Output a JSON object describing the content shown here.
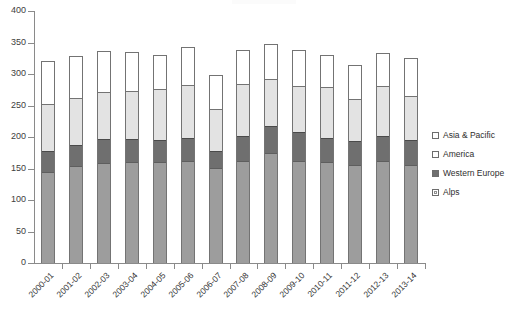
{
  "chart_data": {
    "type": "bar",
    "subtype": "stacked-vertical",
    "title": "",
    "subtitle": "",
    "xlabel": "",
    "ylabel": "",
    "ylim": [
      0,
      400
    ],
    "yticks": [
      0,
      50,
      100,
      150,
      200,
      250,
      300,
      350,
      400
    ],
    "ytick_labels": [
      "0",
      "50",
      "100",
      "150",
      "200",
      "250",
      "300",
      "350",
      "400"
    ],
    "grid": false,
    "legend_position": "right",
    "categories": [
      "2000-01",
      "2001-02",
      "2002-03",
      "2003-04",
      "2004-05",
      "2005-06",
      "2006-07",
      "2007-08",
      "2008-09",
      "2009-10",
      "2010-11",
      "2011-12",
      "2012-13",
      "2013-14"
    ],
    "stack_order_bottom_to_top": [
      "Alps",
      "Western Europe",
      "America",
      "Asia & Pacific"
    ],
    "series": [
      {
        "name": "Alps",
        "color": "#9d9d9d",
        "values": [
          145,
          155,
          159,
          161,
          161,
          163,
          152,
          162,
          175,
          163,
          161,
          156,
          163,
          157
        ]
      },
      {
        "name": "Western Europe",
        "color": "#6f6f6f",
        "values": [
          33,
          34,
          38,
          36,
          35,
          37,
          26,
          41,
          44,
          46,
          38,
          38,
          40,
          39
        ]
      },
      {
        "name": "America",
        "color": "#e3e3e3",
        "values": [
          75,
          74,
          75,
          78,
          81,
          84,
          68,
          82,
          74,
          74,
          81,
          68,
          80,
          71
        ]
      },
      {
        "name": "Asia & Pacific",
        "color": "#ffffff",
        "values": [
          67,
          65,
          65,
          60,
          53,
          59,
          52,
          53,
          54,
          55,
          50,
          52,
          50,
          59
        ]
      }
    ],
    "totals": [
      320,
      328,
      337,
      335,
      330,
      343,
      298,
      338,
      347,
      338,
      330,
      314,
      333,
      326
    ]
  },
  "legend": {
    "items": [
      {
        "label": "Asia & Pacific",
        "swatch": "legend-swatch-asia"
      },
      {
        "label": "America",
        "swatch": "legend-swatch-america"
      },
      {
        "label": "Western Europe",
        "swatch": "legend-swatch-western-europe"
      },
      {
        "label": "Alps",
        "swatch": "legend-swatch-alps"
      }
    ]
  }
}
